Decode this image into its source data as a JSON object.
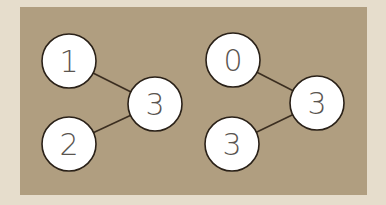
{
  "colors": {
    "background": "#e6ddcc",
    "panel": "#b09e80",
    "node_fill": "#ffffff",
    "node_stroke": "#2a2118",
    "edge": "#3b2e20"
  },
  "graphs": [
    {
      "nodes": [
        {
          "label": "1",
          "x": 69,
          "y": 61
        },
        {
          "label": "3",
          "x": 155,
          "y": 104
        },
        {
          "label": "2",
          "x": 69,
          "y": 144
        }
      ],
      "edges": [
        [
          0,
          1
        ],
        [
          2,
          1
        ]
      ]
    },
    {
      "nodes": [
        {
          "label": "0",
          "x": 233,
          "y": 60
        },
        {
          "label": "3",
          "x": 317,
          "y": 103
        },
        {
          "label": "3",
          "x": 232,
          "y": 144
        }
      ],
      "edges": [
        [
          0,
          1
        ],
        [
          2,
          1
        ]
      ]
    }
  ]
}
